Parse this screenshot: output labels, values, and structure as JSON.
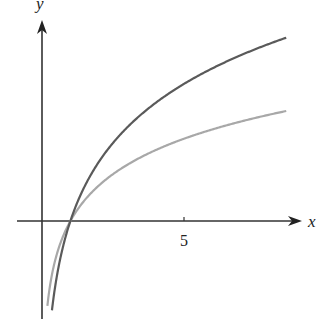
{
  "chart_data": {
    "type": "line",
    "title": "",
    "xlabel": "x",
    "ylabel": "y",
    "x_ticks": [
      5
    ],
    "x_tick_labels": [
      "5"
    ],
    "xlim": [
      -1.5,
      9.6
    ],
    "ylim": [
      -3.5,
      7.8
    ],
    "grid": false,
    "legend": "none",
    "series": [
      {
        "name": "dark curve (steeper logarithm)",
        "color": "#555555",
        "x": [
          0.35,
          0.5,
          1,
          2,
          3,
          5,
          7,
          8.6
        ],
        "values": [
          -3.15,
          -2.08,
          0,
          2.08,
          3.3,
          4.83,
          5.84,
          6.46
        ]
      },
      {
        "name": "light curve (flatter logarithm)",
        "color": "#a8a8a8",
        "x": [
          0.2,
          0.5,
          1,
          2,
          3,
          5,
          7,
          8.6
        ],
        "values": [
          -2.9,
          -1.25,
          0,
          1.25,
          1.98,
          2.9,
          3.5,
          3.88
        ]
      }
    ],
    "annotations": [
      "both curves cross the x-axis at x = 1"
    ]
  },
  "axes": {
    "x_label": "x",
    "y_label": "y",
    "tick_5": "5"
  }
}
